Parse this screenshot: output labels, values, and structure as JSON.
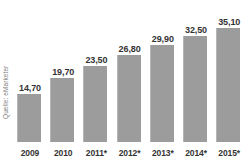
{
  "chart_data": {
    "type": "bar",
    "title": "",
    "xlabel": "",
    "ylabel": "",
    "categories": [
      "2009",
      "2010",
      "2011*",
      "2012*",
      "2013*",
      "2014*",
      "2015*"
    ],
    "values": [
      14.7,
      19.7,
      23.5,
      26.8,
      29.9,
      32.5,
      35.1
    ],
    "value_labels": [
      "14,70",
      "19,70",
      "23,50",
      "26,80",
      "29,90",
      "32,50",
      "35,10"
    ],
    "ylim": [
      0,
      38.5
    ],
    "grid": false,
    "legend": null,
    "series": [
      {
        "name": "",
        "values": [
          14.7,
          19.7,
          23.5,
          26.8,
          29.9,
          32.5,
          35.1
        ]
      }
    ],
    "bar_color": "#9c9c9c",
    "label_color": "#333333",
    "source_note": "Quelle: eMarketer"
  },
  "source": {
    "label": "Quelle: eMarketer"
  },
  "title_sliver": {
    "text": ""
  }
}
